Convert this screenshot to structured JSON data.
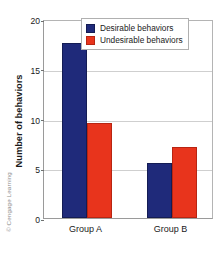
{
  "watermark": "© Cengage Learning",
  "chart_data": {
    "type": "bar",
    "title": "",
    "xlabel": "",
    "ylabel": "Number of behaviors",
    "categories": [
      "Group A",
      "Group B"
    ],
    "series": [
      {
        "name": "Desirable behaviors",
        "values": [
          17.6,
          5.5
        ],
        "color": "#1f2a7a"
      },
      {
        "name": "Undesirable behaviors",
        "values": [
          9.5,
          7.1
        ],
        "color": "#e8341c"
      }
    ],
    "ylim": [
      0,
      20
    ],
    "yticks": [
      0,
      5,
      10,
      15,
      20
    ],
    "ytick_labels": [
      "0",
      "5",
      "10",
      "15",
      "20"
    ],
    "grid": true,
    "legend_position": "top-right"
  }
}
